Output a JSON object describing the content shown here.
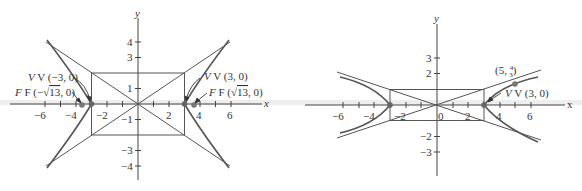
{
  "figures": [
    {
      "id": "left",
      "equation_shape": "hyperbola x^2/9 - y^2/4 = 1",
      "axis_labels": {
        "x": "x",
        "y": "y"
      },
      "x_ticks": [
        "−6",
        "−4",
        "−2",
        "2",
        "4",
        "6"
      ],
      "y_ticks": [
        "4",
        "3",
        "1",
        "−1",
        "−3",
        "−4"
      ],
      "labels": {
        "v_left": "V (−3, 0)",
        "f_left_prefix": "F (−",
        "f_left_root": "13",
        "f_left_suffix": ", 0)",
        "v_right": "V (3, 0)",
        "f_right_prefix": "F (",
        "f_right_root": "13",
        "f_right_suffix": ", 0)"
      }
    },
    {
      "id": "right",
      "equation_shape": "hyperbola x^2/9 - y^2 = 1",
      "axis_labels": {
        "x": "x",
        "y": "y"
      },
      "x_ticks": [
        "−6",
        "−4",
        "−2",
        "0",
        "2",
        "4",
        "6"
      ],
      "y_ticks": [
        "3",
        "2",
        "−2",
        "−3"
      ],
      "labels": {
        "point_prefix": "(5, ",
        "point_num": "4",
        "point_den": "3",
        "point_suffix": ")",
        "v_right": "V (3, 0)"
      }
    }
  ]
}
